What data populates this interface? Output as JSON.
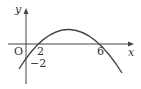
{
  "diagram": {
    "type": "function-graph",
    "axes": {
      "x_label": "x",
      "y_label": "y",
      "origin_label": "O"
    },
    "ticks": {
      "x": [
        "2",
        "6"
      ],
      "y": [
        "-2"
      ]
    },
    "tick_labels": {
      "x2": "2",
      "x6": "6",
      "yneg2": "−2"
    },
    "curve": {
      "equation": "y = -(1/6)(x-2)(x-6)",
      "roots": [
        2,
        6
      ],
      "y_intercept": -2
    },
    "colors": {
      "stroke": "#444444"
    }
  }
}
